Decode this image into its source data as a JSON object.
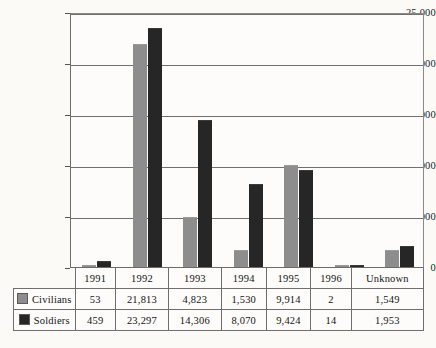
{
  "chart_data": {
    "type": "bar",
    "title": "",
    "xlabel": "",
    "ylabel": "",
    "categories": [
      "1991",
      "1992",
      "1993",
      "1994",
      "1995",
      "1996",
      "Unknown"
    ],
    "series": [
      {
        "name": "Civilians",
        "color": "#8d8d8d",
        "values": [
          53,
          21813,
          4823,
          1530,
          9914,
          2,
          1549
        ],
        "labels": [
          "53",
          "21,813",
          "4,823",
          "1,530",
          "9,914",
          "2",
          "1,549"
        ]
      },
      {
        "name": "Soldiers",
        "color": "#262626",
        "values": [
          459,
          23297,
          14306,
          8070,
          9424,
          14,
          1953
        ],
        "labels": [
          "459",
          "23,297",
          "14,306",
          "8,070",
          "9,424",
          "14",
          "1,953"
        ]
      }
    ],
    "ylim": [
      0,
      25000
    ],
    "ytick_values": [
      25000,
      20000,
      15000,
      10000,
      5000,
      0
    ],
    "ytick_labels": [
      "25,000",
      "20,000",
      "15,000",
      "10,000",
      "5,000",
      "0"
    ],
    "grid": true,
    "legend_position": "table-first-column"
  },
  "table": {
    "corner_label": "",
    "column_headers": [
      "1991",
      "1992",
      "1993",
      "1994",
      "1995",
      "1996",
      "Unknown"
    ],
    "rows": [
      {
        "label": "Civilians",
        "swatch": "civilians-swatch",
        "cells": [
          "53",
          "21,813",
          "4,823",
          "1,530",
          "9,914",
          "2",
          "1,549"
        ]
      },
      {
        "label": "Soldiers",
        "swatch": "soldiers-swatch",
        "cells": [
          "459",
          "23,297",
          "14,306",
          "8,070",
          "9,424",
          "14",
          "1,953"
        ]
      }
    ]
  }
}
